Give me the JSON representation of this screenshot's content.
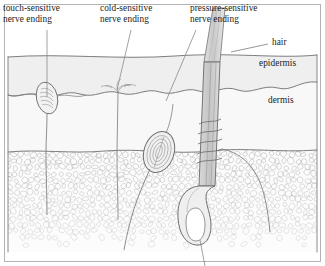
{
  "figure": {
    "style": "pencil line drawing",
    "background_color": "#ffffff",
    "ink_color": "#6b6b6b",
    "text_color": "#1c1c1c",
    "border_color": "#9a9a9a"
  },
  "labels": {
    "touch": "touch-sensitive\nnerve ending",
    "cold": "cold-sensitive\nnerve ending",
    "pressure": "pressure-sensitive\nnerve ending",
    "hair": "hair",
    "epidermis": "epidermis",
    "dermis": "dermis"
  },
  "layers": {
    "epidermis": {
      "name": "epidermis",
      "fill": "#f0f0f0"
    },
    "dermis": {
      "name": "dermis",
      "fill": "#f7f7f7"
    },
    "fat": {
      "name": "subcutaneous fat",
      "fill": "#fbfbfb"
    }
  },
  "structures": {
    "touch_corpuscle": "meissner-corpuscle",
    "cold_ending": "free-nerve-ending",
    "pressure_corpuscle": "pacinian-corpuscle",
    "hair_shaft": "hair-shaft",
    "hair_follicle": "hair-follicle",
    "hair_bulb": "hair-bulb"
  }
}
